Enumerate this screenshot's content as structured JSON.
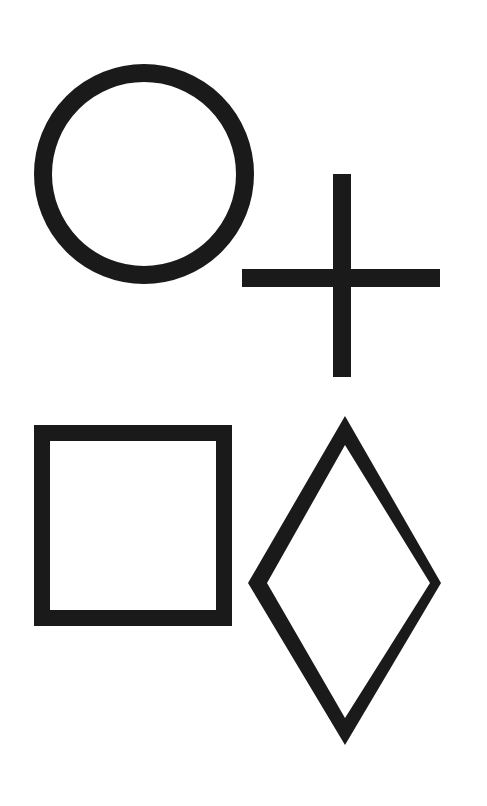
{
  "figure": {
    "background": "#ffffff",
    "stroke_color": "#1a1a1a",
    "shapes": [
      {
        "name": "circle",
        "cx": 144,
        "cy": 174,
        "r": 104,
        "stroke_width": 18
      },
      {
        "name": "cross",
        "vertical": {
          "x": 333,
          "y": 174,
          "w": 18,
          "h": 203
        },
        "horizontal": {
          "x": 242,
          "y": 269,
          "w": 198,
          "h": 18
        }
      },
      {
        "name": "square",
        "x": 42,
        "y": 433,
        "w": 182,
        "h": 185,
        "stroke_width": 16
      },
      {
        "name": "diamond",
        "outer": "345,416 441,583 345,745 248,583",
        "inner": "345,445 430,583 345,718 267,583"
      }
    ]
  }
}
